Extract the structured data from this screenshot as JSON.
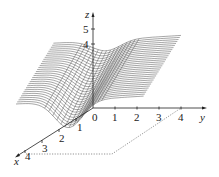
{
  "chart_data": {
    "type": "surface3d",
    "title": "",
    "axes": {
      "x": {
        "label": "x",
        "ticks": [
          "1",
          "2",
          "3",
          "4"
        ],
        "range": [
          0,
          4
        ]
      },
      "y": {
        "label": "y",
        "ticks": [
          "0",
          "1",
          "2",
          "3",
          "4"
        ],
        "range": [
          0,
          4
        ]
      },
      "z": {
        "label": "z",
        "ticks": [
          "4",
          "5"
        ]
      }
    },
    "domain_outline": {
      "style": "dotted",
      "corners": [
        [
          4,
          0
        ],
        [
          4,
          4
        ],
        [
          0,
          4
        ]
      ]
    },
    "grid": false,
    "legend": null
  },
  "labels": {
    "z_axis": "z",
    "y_axis": "y",
    "x_axis": "x",
    "z_ticks": [
      "5",
      "4"
    ],
    "y_ticks": [
      "0",
      "1",
      "2",
      "3",
      "4"
    ],
    "x_ticks": [
      "1",
      "2",
      "3",
      "4"
    ]
  },
  "colors": {
    "line": "#3a3a3a",
    "axis": "#222222",
    "dotted": "#555555"
  }
}
